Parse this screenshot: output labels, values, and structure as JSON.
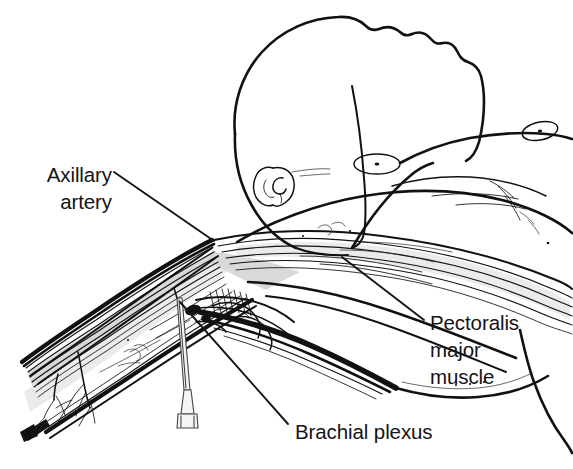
{
  "figure": {
    "background_color": "#ffffff",
    "ink_color": "#111111",
    "shade_color": "#d9d9d9"
  },
  "labels": {
    "axillary_artery": {
      "line1": "Axillary",
      "line2": "artery",
      "align": "right"
    },
    "pectoralis": {
      "line1": "Pectoralis",
      "line2": "major",
      "line3": "muscle",
      "align": "left"
    },
    "brachial_plexus": {
      "line1": "Brachial plexus",
      "align": "left"
    }
  },
  "anatomy_parts": [
    "head",
    "ear",
    "neck",
    "shoulder",
    "chest",
    "left-nipple",
    "right-nipple",
    "pectoralis-major-muscle",
    "axillary-artery",
    "brachial-plexus",
    "upper-arm",
    "injection-needle"
  ]
}
